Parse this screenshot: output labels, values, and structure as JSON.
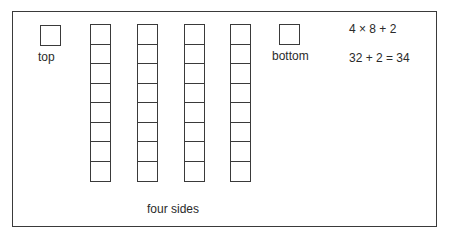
{
  "diagram": {
    "top_face": {
      "label": "top"
    },
    "bottom_face": {
      "label": "bottom"
    },
    "side_columns": {
      "label": "four sides",
      "column_count": 4,
      "cells_per_column": 8
    },
    "equations": {
      "line1": "4 × 8 + 2",
      "line2": "32 + 2 = 34"
    },
    "colors": {
      "stroke": "#3a3a3a",
      "text": "#2a2a2a",
      "background": "#ffffff"
    }
  }
}
